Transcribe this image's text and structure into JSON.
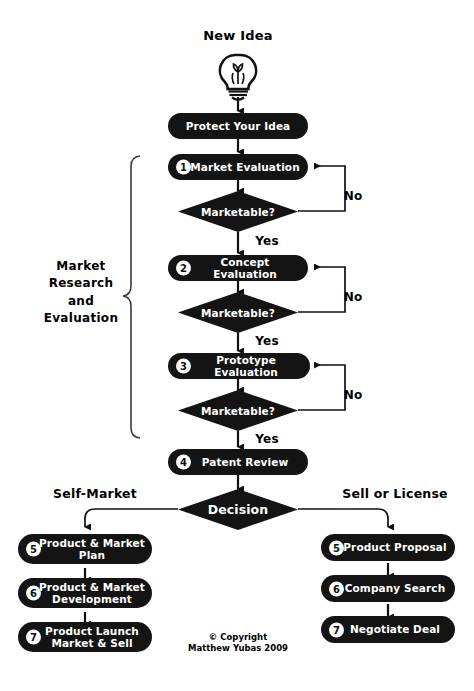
{
  "diagram": {
    "title": "New Idea",
    "start_icon": "lightbulb-icon",
    "copyright": "© Copyright\nMatthew Yubas 2009",
    "group_bracket_label": "Market\nResearch\nand\nEvaluation",
    "branch_label_left": "Self-Market",
    "branch_label_right": "Sell or License",
    "decision_label": "Decision",
    "yes_label": "Yes",
    "no_label": "No",
    "colors": {
      "node_fill": "#141414",
      "node_text": "#ffffff",
      "badge_fill": "#ffffff",
      "badge_text": "#101010",
      "line": "#111111",
      "background": "#ffffff"
    }
  },
  "main_flow": [
    {
      "id": "protect",
      "number": "",
      "label": "Protect Your Idea"
    },
    {
      "id": "market-evaluation",
      "number": "1",
      "label": "Market Evaluation"
    },
    {
      "id": "marketable-1",
      "number": "",
      "label": "Marketable?"
    },
    {
      "id": "concept-evaluation",
      "number": "2",
      "label": "Concept Evaluation"
    },
    {
      "id": "marketable-2",
      "number": "",
      "label": "Marketable?"
    },
    {
      "id": "prototype-evaluation",
      "number": "3",
      "label": "Prototype Evaluation"
    },
    {
      "id": "marketable-3",
      "number": "",
      "label": "Marketable?"
    },
    {
      "id": "patent-review",
      "number": "4",
      "label": "Patent Review"
    },
    {
      "id": "decision",
      "number": "",
      "label": "Decision"
    }
  ],
  "left_branch": [
    {
      "id": "product-market-plan",
      "number": "5",
      "label": "Product & Market\nPlan"
    },
    {
      "id": "product-market-development",
      "number": "6",
      "label": "Product & Market\nDevelopment"
    },
    {
      "id": "product-launch",
      "number": "7",
      "label": "Product Launch\nMarket & Sell"
    }
  ],
  "right_branch": [
    {
      "id": "product-proposal",
      "number": "5",
      "label": "Product Proposal"
    },
    {
      "id": "company-search",
      "number": "6",
      "label": "Company Search"
    },
    {
      "id": "negotiate-deal",
      "number": "7",
      "label": "Negotiate Deal"
    }
  ],
  "edge_labels": {
    "no_1": "No",
    "no_2": "No",
    "no_3": "No",
    "yes_1": "Yes",
    "yes_2": "Yes",
    "yes_3": "Yes"
  }
}
